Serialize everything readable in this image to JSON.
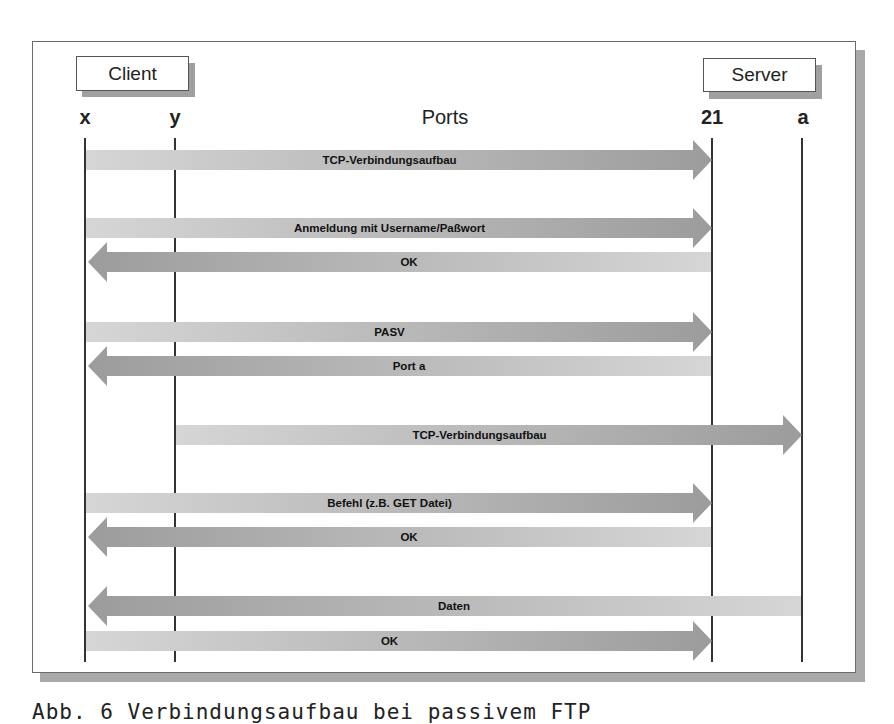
{
  "diagram": {
    "client_label": "Client",
    "server_label": "Server",
    "ports_title": "Ports",
    "ports": {
      "x": "x",
      "y": "y",
      "p21": "21",
      "a": "a"
    },
    "colors": {
      "arrow_light": "#d4d4d4",
      "arrow_dark": "#a2a2a2",
      "lifeline": "#333333",
      "frame_shadow": "#a8a8a8"
    },
    "messages": [
      {
        "label": "TCP-Verbindungsaufbau",
        "from": "x",
        "to": "21",
        "direction": "right"
      },
      {
        "label": "Anmeldung mit Username/Paßwort",
        "from": "x",
        "to": "21",
        "direction": "right"
      },
      {
        "label": "OK",
        "from": "21",
        "to": "x",
        "direction": "left"
      },
      {
        "label": "PASV",
        "from": "x",
        "to": "21",
        "direction": "right"
      },
      {
        "label": "Port a",
        "from": "21",
        "to": "x",
        "direction": "left"
      },
      {
        "label": "TCP-Verbindungsaufbau",
        "from": "y",
        "to": "a",
        "direction": "right"
      },
      {
        "label": "Befehl (z.B. GET Datei)",
        "from": "x",
        "to": "21",
        "direction": "right"
      },
      {
        "label": "OK",
        "from": "21",
        "to": "x",
        "direction": "left"
      },
      {
        "label": "Daten",
        "from": "a",
        "to": "x",
        "direction": "left"
      },
      {
        "label": "OK",
        "from": "x",
        "to": "21",
        "direction": "right"
      }
    ]
  },
  "caption": "Abb. 6  Verbindungsaufbau bei passivem FTP"
}
